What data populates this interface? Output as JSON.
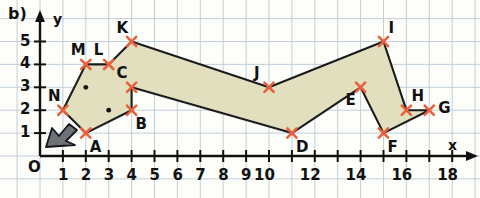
{
  "figure": {
    "part_label": "b)",
    "axis_x_name": "x",
    "axis_y_name": "y",
    "origin_label": "O"
  },
  "axes": {
    "x_ticks": [
      "1",
      "2",
      "3",
      "4",
      "5",
      "6",
      "7",
      "8",
      "9",
      "10",
      "12",
      "14",
      "16",
      "18"
    ],
    "x_tick_values": [
      1,
      2,
      3,
      4,
      5,
      6,
      7,
      8,
      9,
      10,
      12,
      14,
      16,
      18
    ],
    "y_ticks": [
      "1",
      "2",
      "3",
      "4",
      "5"
    ],
    "y_tick_values": [
      1,
      2,
      3,
      4,
      5
    ],
    "x_min": 0,
    "x_max": 19,
    "y_min": 0,
    "y_max": 5.8,
    "grid": true
  },
  "chart_data": {
    "type": "scatter",
    "title": "b)",
    "xlabel": "x",
    "ylabel": "y",
    "xlim": [
      0,
      19
    ],
    "ylim": [
      0,
      5.8
    ],
    "grid": true,
    "series": [
      {
        "name": "polygon-vertices",
        "marker": "cross",
        "marker_color": "#e8603c",
        "fill_color": "#e2dfbe",
        "closed": true,
        "points": [
          {
            "label": "A",
            "x": 2,
            "y": 1,
            "label_pos": "below-right"
          },
          {
            "label": "B",
            "x": 4,
            "y": 2,
            "label_pos": "below-right"
          },
          {
            "label": "C",
            "x": 4,
            "y": 3,
            "label_pos": "above-left"
          },
          {
            "label": "D",
            "x": 11,
            "y": 1,
            "label_pos": "below-right"
          },
          {
            "label": "E",
            "x": 14,
            "y": 3,
            "label_pos": "below-left"
          },
          {
            "label": "F",
            "x": 15,
            "y": 1,
            "label_pos": "below-right"
          },
          {
            "label": "G",
            "x": 17,
            "y": 2,
            "label_pos": "right"
          },
          {
            "label": "H",
            "x": 16,
            "y": 2,
            "label_pos": "above-right"
          },
          {
            "label": "I",
            "x": 15,
            "y": 5,
            "label_pos": "above-right"
          },
          {
            "label": "J",
            "x": 10,
            "y": 3,
            "label_pos": "above-left"
          },
          {
            "label": "K",
            "x": 4,
            "y": 5,
            "label_pos": "above-left"
          },
          {
            "label": "L",
            "x": 3,
            "y": 4,
            "label_pos": "above-left"
          },
          {
            "label": "M",
            "x": 2,
            "y": 4,
            "label_pos": "above-left"
          },
          {
            "label": "N",
            "x": 1,
            "y": 2,
            "label_pos": "above-left"
          }
        ]
      },
      {
        "name": "interior-dots",
        "marker": "dot",
        "marker_color": "#111111",
        "points": [
          {
            "x": 2,
            "y": 3
          },
          {
            "x": 3,
            "y": 2
          }
        ]
      }
    ],
    "annotations": [
      {
        "name": "cursor-arrow",
        "x": 1.3,
        "y": 1.4,
        "shape": "mouse-pointer"
      }
    ]
  }
}
